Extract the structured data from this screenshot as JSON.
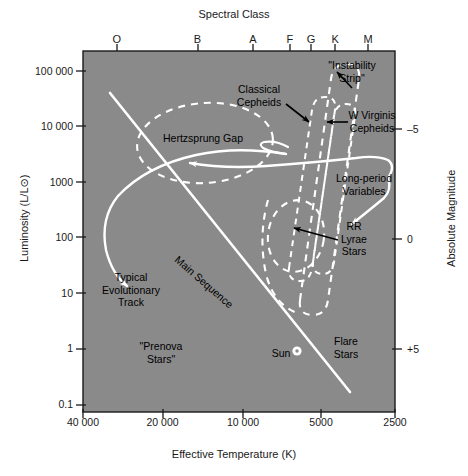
{
  "figure": {
    "type": "hertzsprung-russell-diagram",
    "background_color": "#8a8a8a",
    "curve_color": "#ffffff",
    "text_color": "#1a1a1a"
  },
  "top_axis": {
    "title": "Spectral Class",
    "ticks": [
      {
        "label": "O",
        "x_frac": 0.108
      },
      {
        "label": "B",
        "x_frac": 0.367
      },
      {
        "label": "A",
        "x_frac": 0.545
      },
      {
        "label": "F",
        "x_frac": 0.663
      },
      {
        "label": "G",
        "x_frac": 0.731
      },
      {
        "label": "K",
        "x_frac": 0.808
      },
      {
        "label": "M",
        "x_frac": 0.914
      }
    ]
  },
  "left_axis": {
    "title": "Luminosity (L/L⊙)",
    "ticks": [
      {
        "label": "100 000",
        "y_frac": 0.055
      },
      {
        "label": "10 000",
        "y_frac": 0.208
      },
      {
        "label": "1000",
        "y_frac": 0.362
      },
      {
        "label": "100",
        "y_frac": 0.516
      },
      {
        "label": "10",
        "y_frac": 0.67
      },
      {
        "label": "1",
        "y_frac": 0.824
      },
      {
        "label": "0.1",
        "y_frac": 0.978
      }
    ]
  },
  "right_axis": {
    "title": "Absolute Magnitude",
    "ticks": [
      {
        "label": "–5",
        "y_frac": 0.215
      },
      {
        "label": "0",
        "y_frac": 0.52
      },
      {
        "label": "+5",
        "y_frac": 0.825
      }
    ]
  },
  "bottom_axis": {
    "title": "Effective Temperature (K)",
    "ticks": [
      {
        "label": "40 000",
        "x_frac": 0.0
      },
      {
        "label": "20 000",
        "x_frac": 0.255
      },
      {
        "label": "10 000",
        "x_frac": 0.513
      },
      {
        "label": "5000",
        "x_frac": 0.763
      },
      {
        "label": "2500",
        "x_frac": 1.0
      }
    ]
  },
  "annotations": [
    {
      "name": "instability-strip",
      "text": "\"Instability\nStrip\"",
      "x": 352,
      "y": 72,
      "rot": 0
    },
    {
      "name": "classical-cepheids",
      "text": "Classical\nCepheids",
      "x": 259,
      "y": 96,
      "rot": 0
    },
    {
      "name": "w-virginis-cepheids",
      "text": "W Virginis\nCepheids",
      "x": 372,
      "y": 122,
      "rot": 0
    },
    {
      "name": "hertzsprung-gap",
      "text": "Hertzsprung Gap",
      "x": 203,
      "y": 138,
      "rot": 0
    },
    {
      "name": "long-period-variables",
      "text": "Long-period\nVariables",
      "x": 364,
      "y": 185,
      "rot": 0
    },
    {
      "name": "rr-lyrae-stars",
      "text": "RR\nLyrae\nStars",
      "x": 354,
      "y": 239,
      "rot": 0
    },
    {
      "name": "main-sequence",
      "text": "Main Sequence",
      "x": 204,
      "y": 282,
      "rot": 41
    },
    {
      "name": "typical-evolutionary-track",
      "text": "Typical\nEvolutionary\nTrack",
      "x": 131,
      "y": 290,
      "rot": 0
    },
    {
      "name": "prenova-stars",
      "text": "\"Prenova\nStars\"",
      "x": 161,
      "y": 353,
      "rot": 0
    },
    {
      "name": "sun",
      "text": "Sun",
      "x": 281,
      "y": 353,
      "rot": 0
    },
    {
      "name": "flare-stars",
      "text": "Flare\nStars",
      "x": 346,
      "y": 348,
      "rot": 0
    }
  ],
  "chart_data": {
    "type": "scatter",
    "xlabel": "Effective Temperature (K)",
    "ylabel": "Luminosity (L/L⊙)",
    "xlim": [
      40000,
      2500
    ],
    "ylim": [
      0.1,
      100000
    ],
    "x_scale": "log-reversed",
    "y_scale": "log",
    "grid": false,
    "legend": "none",
    "secondary_xaxis": {
      "label": "Spectral Class",
      "categories": [
        "O",
        "B",
        "A",
        "F",
        "G",
        "K",
        "M"
      ]
    },
    "secondary_yaxis": {
      "label": "Absolute Magnitude",
      "ticks": [
        -5,
        0,
        5
      ]
    },
    "features": [
      {
        "name": "Main Sequence",
        "kind": "solid-line",
        "description": "diagonal band from hot luminous upper-left to cool dim lower-right"
      },
      {
        "name": "Hertzsprung Gap",
        "kind": "dashed-ellipse",
        "luminosity_range": [
          300,
          20000
        ],
        "temperature_range": [
          13000,
          6000
        ]
      },
      {
        "name": "Instability Strip",
        "kind": "dashed-band",
        "description": "narrow near-vertical band spanning high to low luminosity"
      },
      {
        "name": "Classical Cepheids",
        "kind": "dashed-loop",
        "luminosity_range": [
          700,
          30000
        ]
      },
      {
        "name": "W Virginis Cepheids",
        "kind": "dashed-loop",
        "luminosity_range": [
          300,
          15000
        ]
      },
      {
        "name": "RR Lyrae Stars",
        "kind": "dashed-oval",
        "luminosity_range": [
          40,
          200
        ]
      },
      {
        "name": "Long-period Variables",
        "kind": "solid-arrow-curve"
      },
      {
        "name": "Typical Evolutionary Track",
        "kind": "solid-arrow-curve"
      },
      {
        "name": "Sun",
        "kind": "point-marker",
        "luminosity": 1,
        "temperature": 5800
      },
      {
        "name": "Prenova Stars",
        "kind": "text-region"
      },
      {
        "name": "Flare Stars",
        "kind": "text-region"
      }
    ]
  }
}
